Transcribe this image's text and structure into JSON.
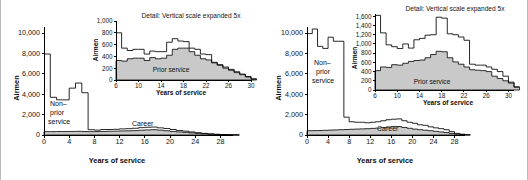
{
  "figure": {
    "panels": [
      {
        "id": "left",
        "name": "airmen-by-years-of-service-panel-a",
        "main": {
          "ylabel": "Airmen",
          "xlabel": "Years of service",
          "yticks": [
            "0",
            "2,000",
            "4,000",
            "6,000",
            "8,000",
            "10,000"
          ],
          "xticks": [
            "0",
            "4",
            "8",
            "12",
            "16",
            "20",
            "24",
            "28"
          ],
          "annotations": {
            "non_prior": "Non–\nprior\nservice",
            "non_prior_line1": "Non–",
            "non_prior_line2": "prior",
            "non_prior_line3": "service",
            "career": "Career"
          }
        },
        "inset": {
          "title": "Detail: Vertical scale expanded 5x",
          "ylabel": "Airmen",
          "xlabel": "Years of service",
          "yticks": [
            "0",
            "200",
            "400",
            "600",
            "800",
            "1000"
          ],
          "xticks": [
            "6",
            "10",
            "14",
            "18",
            "22",
            "26",
            "30"
          ],
          "annotations": {
            "prior": "Prior service"
          }
        }
      },
      {
        "id": "right",
        "name": "airmen-by-years-of-service-panel-b",
        "main": {
          "ylabel": "Airmen",
          "xlabel": "Years of service",
          "yticks": [
            "0",
            "2,000",
            "4,000",
            "6,000",
            "8,000",
            "10,000"
          ],
          "xticks": [
            "0",
            "4",
            "8",
            "12",
            "16",
            "20",
            "24",
            "28"
          ],
          "annotations": {
            "non_prior": "Non–\nprior\nservice",
            "non_prior_line1": "Non–",
            "non_prior_line2": "prior",
            "non_prior_line3": "service",
            "career": "Career"
          }
        },
        "inset": {
          "title": "Detail: Vertical scale expanded 5x",
          "ylabel": "Airmen",
          "xlabel": "Years of service",
          "yticks": [
            "0",
            "200",
            "400",
            "600",
            "800",
            "1000",
            "1200",
            "1400",
            "1600"
          ],
          "xticks": [
            "6",
            "10",
            "14",
            "18",
            "22",
            "26",
            "30"
          ],
          "annotations": {
            "prior": "Prior service"
          }
        }
      }
    ],
    "colors": {
      "prior_service_fill": "#c9c9c9",
      "line": "#000000",
      "background": "#ffffff",
      "rule": "#b9b9b9"
    }
  },
  "chart_data": [
    {
      "id": "panel-a-main",
      "type": "area",
      "title": "",
      "xlabel": "Years of service",
      "ylabel": "Airmen",
      "xlim": [
        0,
        30
      ],
      "ylim": [
        0,
        10600
      ],
      "xticks": [
        0,
        4,
        8,
        12,
        16,
        20,
        24,
        28
      ],
      "yticks": [
        0,
        2000,
        4000,
        6000,
        8000,
        10000
      ],
      "grid": false,
      "legend": "inline-annotations",
      "x": [
        0,
        1,
        2,
        3,
        4,
        5,
        6,
        7,
        8,
        9,
        10,
        11,
        12,
        13,
        14,
        15,
        16,
        17,
        18,
        19,
        20,
        21,
        22,
        23,
        24,
        25,
        26,
        27,
        28,
        29,
        30
      ],
      "series": [
        {
          "name": "Total",
          "values": [
            7950,
            3700,
            3450,
            3450,
            4600,
            5100,
            4150,
            520,
            480,
            540,
            540,
            560,
            600,
            620,
            660,
            720,
            760,
            780,
            700,
            640,
            540,
            440,
            380,
            300,
            220,
            160,
            110,
            70,
            45,
            25,
            10
          ]
        },
        {
          "name": "Prior service",
          "values": [
            330,
            330,
            340,
            340,
            350,
            360,
            340,
            330,
            340,
            350,
            370,
            380,
            400,
            410,
            430,
            470,
            500,
            520,
            480,
            420,
            350,
            300,
            260,
            210,
            160,
            120,
            85,
            55,
            35,
            18,
            8
          ]
        }
      ]
    },
    {
      "id": "panel-a-inset",
      "type": "area",
      "title": "Detail: Vertical scale expanded 5x",
      "xlabel": "Years of service",
      "ylabel": "Airmen",
      "xlim": [
        6,
        30
      ],
      "ylim": [
        0,
        1000
      ],
      "xticks": [
        6,
        10,
        14,
        18,
        22,
        26,
        30
      ],
      "yticks": [
        0,
        200,
        400,
        600,
        800,
        1000
      ],
      "grid": false,
      "x": [
        6,
        7,
        8,
        9,
        10,
        11,
        12,
        13,
        14,
        15,
        16,
        17,
        18,
        19,
        20,
        21,
        22,
        23,
        24,
        25,
        26,
        27,
        28,
        29,
        30
      ],
      "series": [
        {
          "name": "Total",
          "values": [
            800,
            540,
            500,
            520,
            520,
            440,
            490,
            480,
            480,
            640,
            700,
            660,
            650,
            540,
            520,
            440,
            430,
            300,
            260,
            220,
            180,
            140,
            100,
            60,
            20
          ]
        },
        {
          "name": "Prior service",
          "values": [
            330,
            320,
            360,
            370,
            370,
            330,
            380,
            360,
            370,
            420,
            520,
            540,
            540,
            480,
            420,
            360,
            340,
            290,
            250,
            200,
            165,
            125,
            90,
            50,
            15
          ]
        }
      ]
    },
    {
      "id": "panel-b-main",
      "type": "area",
      "title": "",
      "xlabel": "Years of service",
      "ylabel": "Airmen",
      "xlim": [
        0,
        30
      ],
      "ylim": [
        0,
        10600
      ],
      "xticks": [
        0,
        4,
        8,
        12,
        16,
        20,
        24,
        28
      ],
      "yticks": [
        0,
        2000,
        4000,
        6000,
        8000,
        10000
      ],
      "grid": false,
      "legend": "inline-annotations",
      "x": [
        0,
        1,
        2,
        3,
        4,
        5,
        6,
        7,
        8,
        9,
        10,
        11,
        12,
        13,
        14,
        15,
        16,
        17,
        18,
        19,
        20,
        21,
        22,
        23,
        24,
        25,
        26,
        27,
        28,
        29,
        30
      ],
      "series": [
        {
          "name": "Total",
          "values": [
            9950,
            10400,
            8700,
            8500,
            9600,
            9200,
            9200,
            1750,
            1300,
            1250,
            1250,
            1200,
            1250,
            1300,
            1400,
            1500,
            1550,
            1580,
            1400,
            1250,
            1150,
            1000,
            950,
            800,
            700,
            620,
            520,
            330,
            160,
            80,
            30
          ]
        },
        {
          "name": "Prior service",
          "values": [
            420,
            430,
            440,
            460,
            480,
            500,
            520,
            540,
            560,
            580,
            600,
            620,
            650,
            680,
            720,
            790,
            840,
            830,
            740,
            660,
            580,
            520,
            470,
            420,
            360,
            300,
            240,
            160,
            90,
            45,
            15
          ]
        }
      ]
    },
    {
      "id": "panel-b-inset",
      "type": "area",
      "title": "Detail: Vertical scale expanded 5x",
      "xlabel": "Years of service",
      "ylabel": "Airmen",
      "xlim": [
        6,
        31
      ],
      "ylim": [
        0,
        1650
      ],
      "xticks": [
        6,
        10,
        14,
        18,
        22,
        26,
        30
      ],
      "yticks": [
        0,
        200,
        400,
        600,
        800,
        1000,
        1200,
        1400,
        1600
      ],
      "grid": false,
      "x": [
        6,
        7,
        8,
        9,
        10,
        11,
        12,
        13,
        14,
        15,
        16,
        17,
        18,
        19,
        20,
        21,
        22,
        23,
        24,
        25,
        26,
        27,
        28,
        29,
        30,
        31
      ],
      "series": [
        {
          "name": "Total",
          "values": [
            1620,
            1240,
            980,
            940,
            900,
            1000,
            910,
            1090,
            1120,
            1190,
            1200,
            1580,
            1560,
            1220,
            1200,
            1150,
            1080,
            560,
            540,
            540,
            500,
            450,
            400,
            300,
            170,
            70
          ]
        },
        {
          "name": "Prior service",
          "values": [
            420,
            500,
            490,
            550,
            540,
            580,
            620,
            640,
            650,
            700,
            770,
            840,
            830,
            700,
            610,
            560,
            500,
            440,
            430,
            420,
            400,
            300,
            250,
            200,
            150,
            60
          ]
        }
      ]
    }
  ]
}
